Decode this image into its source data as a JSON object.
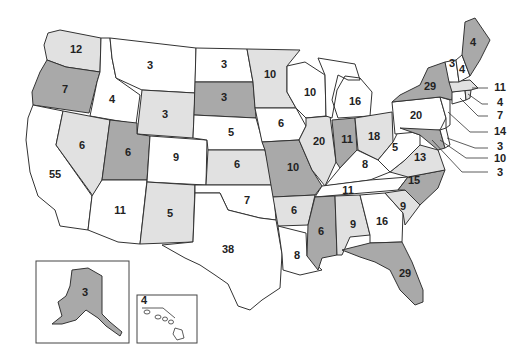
{
  "map": {
    "title": "US Electoral Votes by State",
    "colors": {
      "dark": "#a9a9a9",
      "light": "#e1e1e1",
      "white": "#ffffff",
      "border": "#333333"
    },
    "states": [
      {
        "id": "WA",
        "votes": "12",
        "shade": "light"
      },
      {
        "id": "OR",
        "votes": "7",
        "shade": "dark"
      },
      {
        "id": "CA",
        "votes": "55",
        "shade": "white"
      },
      {
        "id": "ID",
        "votes": "4",
        "shade": "white"
      },
      {
        "id": "NV",
        "votes": "6",
        "shade": "light"
      },
      {
        "id": "MT",
        "votes": "3",
        "shade": "white"
      },
      {
        "id": "WY",
        "votes": "3",
        "shade": "light"
      },
      {
        "id": "UT",
        "votes": "6",
        "shade": "dark"
      },
      {
        "id": "AZ",
        "votes": "11",
        "shade": "white"
      },
      {
        "id": "CO",
        "votes": "9",
        "shade": "white"
      },
      {
        "id": "NM",
        "votes": "5",
        "shade": "light"
      },
      {
        "id": "ND",
        "votes": "3",
        "shade": "white"
      },
      {
        "id": "SD",
        "votes": "3",
        "shade": "dark"
      },
      {
        "id": "NE",
        "votes": "5",
        "shade": "white"
      },
      {
        "id": "KS",
        "votes": "6",
        "shade": "light"
      },
      {
        "id": "OK",
        "votes": "7",
        "shade": "white"
      },
      {
        "id": "TX",
        "votes": "38",
        "shade": "white"
      },
      {
        "id": "MN",
        "votes": "10",
        "shade": "light"
      },
      {
        "id": "IA",
        "votes": "6",
        "shade": "white"
      },
      {
        "id": "MO",
        "votes": "10",
        "shade": "dark"
      },
      {
        "id": "AR",
        "votes": "6",
        "shade": "light"
      },
      {
        "id": "LA",
        "votes": "8",
        "shade": "white"
      },
      {
        "id": "WI",
        "votes": "10",
        "shade": "white"
      },
      {
        "id": "IL",
        "votes": "20",
        "shade": "light"
      },
      {
        "id": "MS",
        "votes": "6",
        "shade": "dark"
      },
      {
        "id": "MI",
        "votes": "16",
        "shade": "white"
      },
      {
        "id": "IN",
        "votes": "11",
        "shade": "dark"
      },
      {
        "id": "KY",
        "votes": "8",
        "shade": "white"
      },
      {
        "id": "TN",
        "votes": "11",
        "shade": "white"
      },
      {
        "id": "AL",
        "votes": "9",
        "shade": "light"
      },
      {
        "id": "OH",
        "votes": "18",
        "shade": "light"
      },
      {
        "id": "GA",
        "votes": "16",
        "shade": "white"
      },
      {
        "id": "FL",
        "votes": "29",
        "shade": "dark"
      },
      {
        "id": "WV",
        "votes": "5",
        "shade": "white"
      },
      {
        "id": "VA",
        "votes": "13",
        "shade": "light"
      },
      {
        "id": "NC",
        "votes": "15",
        "shade": "dark"
      },
      {
        "id": "SC",
        "votes": "9",
        "shade": "light"
      },
      {
        "id": "PA",
        "votes": "20",
        "shade": "white"
      },
      {
        "id": "NY",
        "votes": "29",
        "shade": "dark"
      },
      {
        "id": "VT",
        "votes": "3",
        "shade": "white"
      },
      {
        "id": "NH",
        "votes": "4",
        "shade": "white"
      },
      {
        "id": "ME",
        "votes": "4",
        "shade": "dark"
      },
      {
        "id": "AK",
        "votes": "3",
        "shade": "dark"
      },
      {
        "id": "HI",
        "votes": "4",
        "shade": "white"
      }
    ],
    "callouts": [
      {
        "id": "MA",
        "votes": "11"
      },
      {
        "id": "RI",
        "votes": "4"
      },
      {
        "id": "CT",
        "votes": "7"
      },
      {
        "id": "NJ",
        "votes": "14"
      },
      {
        "id": "DE",
        "votes": "3"
      },
      {
        "id": "MD",
        "votes": "10"
      },
      {
        "id": "DC",
        "votes": "3"
      }
    ]
  }
}
